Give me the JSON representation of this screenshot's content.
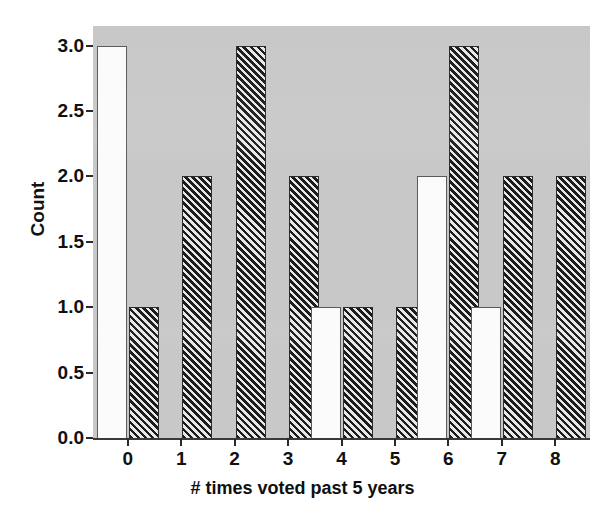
{
  "chart_data": {
    "type": "bar",
    "title": "",
    "xlabel": "# times voted past 5 years",
    "ylabel": "Count",
    "categories": [
      "0",
      "1",
      "2",
      "3",
      "4",
      "5",
      "6",
      "7",
      "8"
    ],
    "xtick_labels": [
      "0",
      "1",
      "2",
      "3",
      "4",
      "5",
      "6",
      "7",
      "8"
    ],
    "ytick_labels": [
      "0.0",
      "0.5",
      "1.0",
      "1.5",
      "2.0",
      "2.5",
      "3.0"
    ],
    "ytick_values": [
      0.0,
      0.5,
      1.0,
      1.5,
      2.0,
      2.5,
      3.0
    ],
    "ylim": [
      0,
      3.15
    ],
    "xlim": [
      -0.65,
      8.65
    ],
    "grid": false,
    "legend": null,
    "series": [
      {
        "name": "white",
        "fill": "solid-white",
        "values": [
          3.0,
          0.0,
          0.0,
          0.0,
          1.0,
          0.0,
          2.0,
          1.0,
          0.0
        ]
      },
      {
        "name": "hatched",
        "fill": "diagonal-hatch",
        "values": [
          1.0,
          2.0,
          3.0,
          2.0,
          1.0,
          1.0,
          3.0,
          2.0,
          2.0
        ]
      }
    ],
    "plot_background": "#c8c8c8",
    "figure_background": "#ffffff",
    "axis_color": "#2a2a2a",
    "white_bar_fill": "#fbfbfb",
    "white_bar_edge": "#5a5a5a",
    "hatch_bar_color": "#1c1c1c"
  }
}
